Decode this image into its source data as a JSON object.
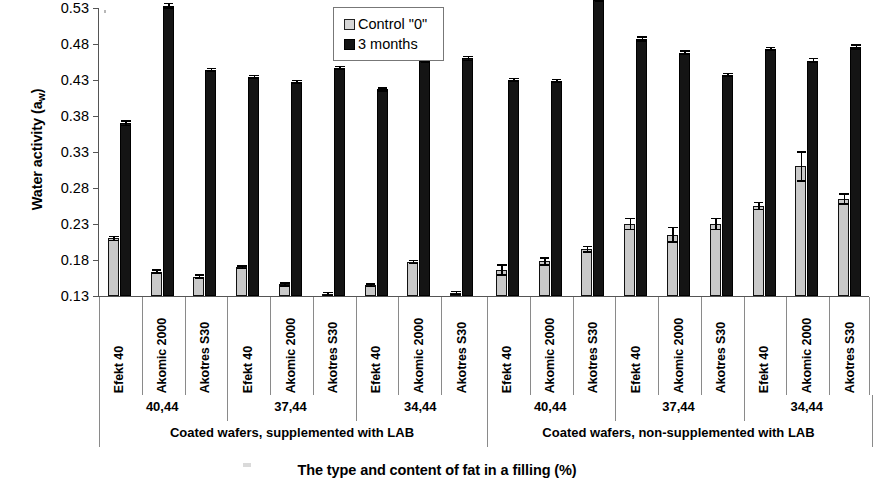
{
  "chart_data": {
    "type": "bar",
    "title": "",
    "xlabel": "The type and content of fat in a filling (%)",
    "ylabel": "Water activity (a_w)",
    "ylim": [
      0.13,
      0.53
    ],
    "yticks": [
      0.13,
      0.18,
      0.23,
      0.28,
      0.33,
      0.38,
      0.43,
      0.48,
      0.53
    ],
    "ytick_labels": [
      "0.13",
      "0.18",
      "0.23",
      "0.28",
      "0.33",
      "0.38",
      "0.43",
      "0.48",
      "0.53"
    ],
    "grid": false,
    "legend_position": "top-center",
    "categories": [
      "Efekt 40",
      "Akomic 2000",
      "Akotres S30",
      "Efekt 40",
      "Akomic 2000",
      "Akotres S30",
      "Efekt 40",
      "Akomic 2000",
      "Akotres S30",
      "Efekt 40",
      "Akomic 2000",
      "Akotres S30",
      "Efekt 40",
      "Akomic 2000",
      "Akotres S30",
      "Efekt 40",
      "Akomic 2000",
      "Akotres S30"
    ],
    "group_fat_content": [
      "40,44",
      "37,44",
      "34,44",
      "40,44",
      "37,44",
      "34,44"
    ],
    "group_treatment": [
      "Coated wafers, supplemented with LAB",
      "Coated wafers, non-supplemented with LAB"
    ],
    "series": [
      {
        "name": "Control \"0\"",
        "color": "#c9c9c9",
        "values": [
          0.21,
          0.164,
          0.157,
          0.17,
          0.146,
          0.133,
          0.145,
          0.177,
          0.134,
          0.166,
          0.178,
          0.195,
          0.23,
          0.215,
          0.23,
          0.255,
          0.31,
          0.265
        ],
        "errors": [
          0.004,
          0.002,
          0.002,
          0.002,
          0.002,
          0.001,
          0.002,
          0.003,
          0.001,
          0.008,
          0.006,
          0.005,
          0.009,
          0.011,
          0.009,
          0.006,
          0.021,
          0.008
        ]
      },
      {
        "name": "3 months",
        "color": "#141414",
        "values": [
          0.37,
          0.533,
          0.444,
          0.434,
          0.427,
          0.447,
          0.417,
          0.456,
          0.46,
          0.43,
          0.429,
          0.541,
          0.487,
          0.468,
          0.437,
          0.473,
          0.457,
          0.476
        ],
        "errors": [
          0.004,
          0.004,
          0.002,
          0.002,
          0.003,
          0.002,
          0.002,
          0.003,
          0.004,
          0.002,
          0.003,
          0.003,
          0.004,
          0.003,
          0.003,
          0.003,
          0.004,
          0.004
        ]
      }
    ]
  },
  "legend": {
    "items": [
      {
        "label": "Control \"0\"",
        "swatch": "control-swatch"
      },
      {
        "label": "3 months",
        "swatch": "months-swatch"
      }
    ]
  },
  "axes": {
    "y_title_main": "Water activity (a",
    "y_title_sub": "w",
    "y_title_tail": ")",
    "x_title": "The type and content of fat in a filling (%)"
  }
}
